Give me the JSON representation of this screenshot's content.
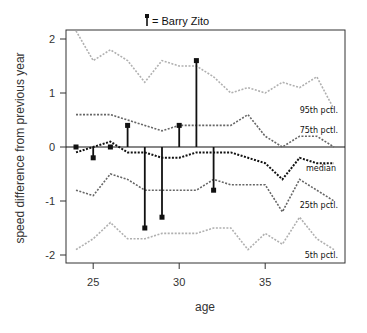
{
  "chart_data": {
    "type": "line",
    "title": "= Barry Zito",
    "legend": {
      "marker": "stem-with-square",
      "label": "= Barry Zito"
    },
    "xlabel": "age",
    "ylabel": "speed difference from previous year",
    "xlim": [
      23.4,
      39.6
    ],
    "ylim": [
      -2.2,
      2.15
    ],
    "xticks": [
      25,
      30,
      35
    ],
    "yticks": [
      -2,
      -1,
      0,
      1,
      2
    ],
    "grid": false,
    "x": [
      24,
      25,
      26,
      27,
      28,
      29,
      30,
      31,
      32,
      33,
      34,
      35,
      36,
      37,
      38,
      39
    ],
    "series": [
      {
        "name": "95th pctl.",
        "style": "dotted",
        "color": "#b0b0b0",
        "values": [
          2.15,
          1.6,
          1.8,
          1.6,
          1.2,
          1.6,
          1.5,
          1.5,
          1.3,
          1.0,
          1.1,
          1.0,
          1.2,
          1.1,
          1.3,
          0.7
        ]
      },
      {
        "name": "75th pctl.",
        "style": "dotted",
        "color": "#666666",
        "values": [
          0.6,
          0.6,
          0.6,
          0.5,
          0.4,
          0.3,
          0.4,
          0.4,
          0.4,
          0.4,
          0.6,
          0.2,
          0.0,
          0.2,
          0.2,
          0.0
        ]
      },
      {
        "name": "median",
        "style": "dotted",
        "color": "#111111",
        "values": [
          -0.1,
          0.0,
          0.1,
          -0.1,
          -0.1,
          -0.2,
          -0.2,
          -0.1,
          -0.1,
          -0.1,
          -0.2,
          -0.3,
          -0.6,
          -0.2,
          -0.3,
          -0.3
        ]
      },
      {
        "name": "25th pctl.",
        "style": "dotted",
        "color": "#666666",
        "values": [
          -0.8,
          -0.9,
          -0.5,
          -0.6,
          -0.8,
          -0.8,
          -0.8,
          -0.8,
          -0.6,
          -0.7,
          -0.7,
          -0.7,
          -1.2,
          -0.6,
          -0.8,
          -1.0
        ]
      },
      {
        "name": "5th pctl.",
        "style": "dotted",
        "color": "#b0b0b0",
        "values": [
          -1.9,
          -1.7,
          -1.4,
          -1.7,
          -1.7,
          -1.6,
          -1.6,
          -1.6,
          -1.5,
          -1.5,
          -1.9,
          -1.6,
          -1.8,
          -1.3,
          -1.7,
          -1.9
        ]
      }
    ],
    "highlight": {
      "name": "Barry Zito",
      "type": "stem",
      "x": [
        24,
        25,
        26,
        27,
        28,
        29,
        30,
        31,
        32
      ],
      "values": [
        0.0,
        -0.2,
        0.0,
        0.4,
        -1.5,
        -1.3,
        0.4,
        1.6,
        -0.8
      ]
    },
    "annotations": [
      {
        "text": "95th pctl.",
        "series": "95th pctl."
      },
      {
        "text": "75th pctl.",
        "series": "75th pctl."
      },
      {
        "text": "median",
        "series": "median"
      },
      {
        "text": "25th pctl.",
        "series": "25th pctl."
      },
      {
        "text": "5th pctl.",
        "series": "5th pctl."
      }
    ],
    "zero_line": true
  }
}
